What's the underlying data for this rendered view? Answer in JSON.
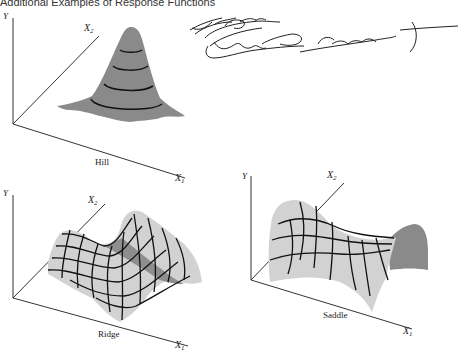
{
  "title": "Additional Examples of Response Functions",
  "colors": {
    "axis": "#333333",
    "hill_fill": "#8a8a8a",
    "surface_light": "#d2d2d2",
    "surface_dark": "#8e8e8e",
    "grid_line": "#111111",
    "handwriting": "#222222"
  },
  "panels": [
    {
      "name": "Hill",
      "axes": {
        "y": "Y",
        "x2": "X",
        "x2_sub": "2",
        "x1": "X",
        "x1_sub": "1"
      },
      "caption": "Hill"
    },
    {
      "name": "Ridge",
      "axes": {
        "y": "Y",
        "x2": "X",
        "x2_sub": "2",
        "x1": "X",
        "x1_sub": "1"
      },
      "caption": "Ridge"
    },
    {
      "name": "Saddle",
      "axes": {
        "y": "Y",
        "x2": "X",
        "x2_sub": "2",
        "x1": "X",
        "x1_sub": "1"
      },
      "caption": "Saddle"
    }
  ],
  "annotation": {
    "type": "handwritten scribble",
    "approx_text": "No Interaction (Effect only by a Constant)"
  }
}
